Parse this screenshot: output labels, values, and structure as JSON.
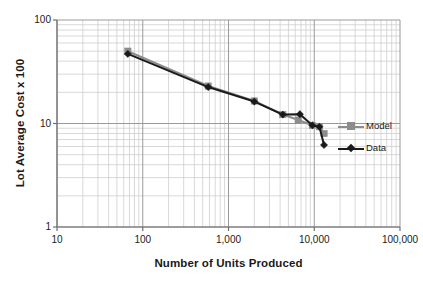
{
  "chart_data": {
    "type": "line",
    "title": "",
    "xlabel": "Number of Units Produced",
    "ylabel": "Lot Average Cost x 100",
    "xscale": "log",
    "yscale": "log",
    "xlim": [
      10,
      100000
    ],
    "ylim": [
      1,
      100
    ],
    "grid": true,
    "grid_minor": true,
    "legend_position": "right",
    "xtick_labels": [
      "10",
      "100",
      "1,000",
      "10,000",
      "100,000"
    ],
    "xtick_values": [
      10,
      100,
      1000,
      10000,
      100000
    ],
    "ytick_labels": [
      "1",
      "10",
      "100"
    ],
    "ytick_values": [
      1,
      10,
      100
    ],
    "series": [
      {
        "name": "Model",
        "color": "#8c8c8c",
        "marker": "square",
        "x": [
          67,
          580,
          2000,
          4300,
          6500,
          9500,
          11500,
          13000
        ],
        "values": [
          50,
          23,
          16.5,
          12.2,
          10.8,
          9.6,
          9.3,
          8.0
        ]
      },
      {
        "name": "Data",
        "color": "#1a1a1a",
        "marker": "diamond",
        "x": [
          67,
          580,
          2000,
          4300,
          6800,
          9500,
          11500,
          13000
        ],
        "values": [
          47,
          22.5,
          16.3,
          12.2,
          12.3,
          9.6,
          9.3,
          6.2
        ]
      }
    ]
  },
  "legend": {
    "items": [
      {
        "label": "Model"
      },
      {
        "label": "Data"
      }
    ]
  },
  "colors": {
    "model": "#8c8c8c",
    "data": "#1a1a1a",
    "grid_major": "#9a9a9a",
    "grid_minor": "#c8c8c8",
    "axis": "#6e6e6e",
    "text": "#1a1a1a",
    "background": "#ffffff"
  },
  "plot_area": {
    "left": 57,
    "top": 20,
    "right": 400,
    "bottom": 227
  }
}
